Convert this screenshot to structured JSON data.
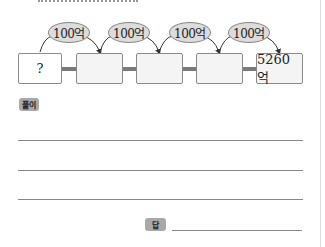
{
  "diagram": {
    "boxes": [
      {
        "value": "?"
      },
      {
        "value": ""
      },
      {
        "value": ""
      },
      {
        "value": ""
      },
      {
        "value": "5260억"
      }
    ],
    "steps": [
      {
        "label": "100억"
      },
      {
        "label": "100억"
      },
      {
        "label": "100억"
      },
      {
        "label": "100억"
      }
    ]
  },
  "solution": {
    "label": "풀이",
    "lines": 3
  },
  "answer": {
    "label": "답",
    "value": ""
  }
}
